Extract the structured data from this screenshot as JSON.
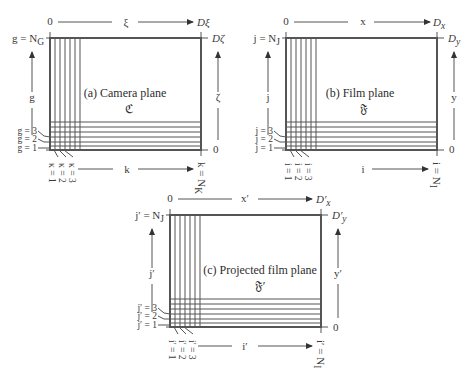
{
  "panels": [
    {
      "id": "a",
      "title": "(a) Camera plane",
      "symbol": "ℭ",
      "top_axis": {
        "origin": "0",
        "label": "ξ",
        "end": "Dξ"
      },
      "left_axis": {
        "top": "g = N",
        "top_sub": "G",
        "label": "g",
        "ticks": [
          "g = 3",
          "g = 2",
          "g = 1"
        ]
      },
      "right_axis": {
        "top": "Dζ",
        "label": "ζ",
        "bottom": "0"
      },
      "bottom_axis": {
        "ticks": [
          "κ = 1",
          "κ = 2",
          "κ = 3"
        ],
        "label": "k",
        "end": "k = N",
        "end_sub": "K"
      }
    },
    {
      "id": "b",
      "title": "(b) Film plane",
      "symbol": "𝔉",
      "top_axis": {
        "origin": "0",
        "label": "x",
        "end": "D",
        "end_sub": "x"
      },
      "left_axis": {
        "top": "j = N",
        "top_sub": "J",
        "label": "j",
        "ticks": [
          "j = 3",
          "j = 2",
          "j = 1"
        ]
      },
      "right_axis": {
        "top": "D",
        "top_sub": "y",
        "label": "y",
        "bottom": "0"
      },
      "bottom_axis": {
        "ticks": [
          "i = 1",
          "i = 2",
          "i = 3"
        ],
        "label": "i",
        "end": "i = N",
        "end_sub": "I"
      }
    },
    {
      "id": "c",
      "title": "(c) Projected film plane",
      "symbol": "𝔉′",
      "top_axis": {
        "origin": "0",
        "label": "x′",
        "end": "D′",
        "end_sub": "x"
      },
      "left_axis": {
        "top": "j′ = N",
        "top_sub": "J",
        "label": "j′",
        "ticks": [
          "j′ = 3",
          "j′ = 2",
          "j′ = 1"
        ]
      },
      "right_axis": {
        "top": "D′",
        "top_sub": "y",
        "label": "y′",
        "bottom": "0"
      },
      "bottom_axis": {
        "ticks": [
          "i′ = 1",
          "i′ = 2",
          "i′ = 3"
        ],
        "label": "i′",
        "end": "i′ = N",
        "end_sub": "I"
      }
    }
  ]
}
